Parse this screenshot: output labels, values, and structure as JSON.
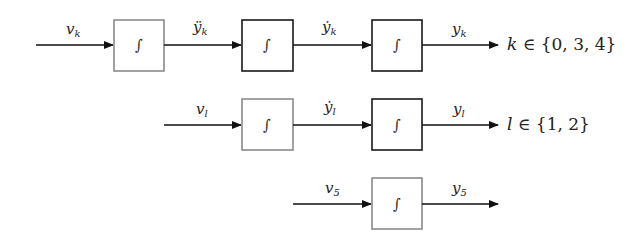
{
  "diagram": {
    "type": "block-diagram",
    "rows": [
      {
        "id": "k",
        "input_label": "v",
        "input_sub": "k",
        "signals": [
          {
            "label": "ÿ",
            "sub": "k"
          },
          {
            "label": "ẏ",
            "sub": "k"
          },
          {
            "label": "y",
            "sub": "k"
          }
        ],
        "integrators": 3,
        "set_text": {
          "var": "k",
          "rel": " ∈ {0, 3, 4}"
        }
      },
      {
        "id": "l",
        "input_label": "v",
        "input_sub": "l",
        "signals": [
          {
            "label": "ẏ",
            "sub": "l"
          },
          {
            "label": "y",
            "sub": "l"
          }
        ],
        "integrators": 2,
        "set_text": {
          "var": "l",
          "rel": " ∈ {1, 2}"
        }
      },
      {
        "id": "5",
        "input_label": "v",
        "input_sub": "5",
        "signals": [
          {
            "label": "y",
            "sub": "5"
          }
        ],
        "integrators": 1
      }
    ],
    "integrator_symbol": "∫",
    "colors": {
      "line": "#111111",
      "box_gray": "#8a8a8a",
      "box_black": "#1a1a1a"
    }
  }
}
